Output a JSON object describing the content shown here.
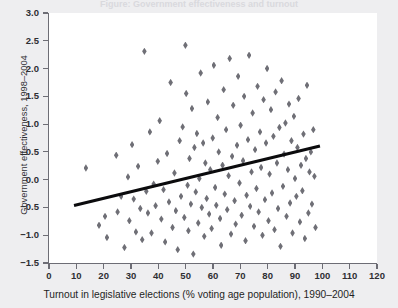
{
  "figure": {
    "clipped_title": "Figure: Government effectiveness and turnout",
    "background_color": "#eeeef0",
    "plot_background_color": "#ffffff",
    "marker_color": "#6f6f76",
    "trendline_color": "#0b0b0d",
    "axis_color": "#6d6d75"
  },
  "chart_data": {
    "type": "scatter",
    "title": "",
    "xlabel": "Turnout in legislative elections (% voting age population), 1990–2004",
    "ylabel": "Government effectiveness, 1998–2004",
    "xlim": [
      0,
      120
    ],
    "ylim": [
      -1.5,
      3.0
    ],
    "xticks": [
      0,
      10,
      20,
      30,
      40,
      50,
      60,
      70,
      80,
      90,
      100,
      110,
      120
    ],
    "yticks": [
      -1.5,
      -1.0,
      -0.5,
      0.0,
      0.5,
      1.0,
      1.5,
      2.0,
      2.5,
      3.0
    ],
    "xtick_labels": [
      "0",
      "10",
      "20",
      "30",
      "40",
      "50",
      "60",
      "70",
      "80",
      "90",
      "100",
      "110",
      "120"
    ],
    "ytick_labels": [
      "-1.5",
      "-1.0",
      "-0.5",
      "0.0",
      "0.5",
      "1.0",
      "1.5",
      "2.0",
      "2.5",
      "3.0"
    ],
    "grid": false,
    "legend": false,
    "marker": "diamond",
    "trendline": {
      "type": "linear-fit",
      "x_start": 9.0,
      "y_start": -0.47,
      "x_end": 99.0,
      "y_end": 0.6
    },
    "points": [
      [
        13.5,
        0.21
      ],
      [
        18.3,
        -0.82
      ],
      [
        20.5,
        -0.66
      ],
      [
        21.2,
        -1.04
      ],
      [
        24.6,
        0.44
      ],
      [
        25.1,
        -0.58
      ],
      [
        26.4,
        -0.3
      ],
      [
        27.6,
        -1.22
      ],
      [
        28.9,
        0.05
      ],
      [
        29.4,
        -0.74
      ],
      [
        30.4,
        0.63
      ],
      [
        31.0,
        -0.35
      ],
      [
        31.8,
        -0.94
      ],
      [
        32.6,
        0.24
      ],
      [
        33.4,
        -0.52
      ],
      [
        34.1,
        -1.08
      ],
      [
        34.9,
        2.31
      ],
      [
        35.6,
        -0.21
      ],
      [
        36.2,
        -0.6
      ],
      [
        36.9,
        0.86
      ],
      [
        37.5,
        -0.96
      ],
      [
        38.3,
        -0.08
      ],
      [
        39.0,
        -0.47
      ],
      [
        39.8,
        0.33
      ],
      [
        40.5,
        1.06
      ],
      [
        41.1,
        -0.71
      ],
      [
        41.9,
        -0.18
      ],
      [
        42.5,
        -1.12
      ],
      [
        43.2,
        0.47
      ],
      [
        43.9,
        -0.4
      ],
      [
        44.5,
        1.75
      ],
      [
        45.2,
        -0.86
      ],
      [
        45.9,
        0.12
      ],
      [
        46.4,
        -0.56
      ],
      [
        47.1,
        -1.26
      ],
      [
        47.8,
        0.7
      ],
      [
        48.3,
        -0.3
      ],
      [
        48.9,
        0.95
      ],
      [
        49.5,
        -0.68
      ],
      [
        49.9,
        2.42
      ],
      [
        50.2,
        1.55
      ],
      [
        50.7,
        -0.1
      ],
      [
        51.0,
        -0.92
      ],
      [
        51.4,
        0.38
      ],
      [
        51.9,
        -0.44
      ],
      [
        52.3,
        1.28
      ],
      [
        52.8,
        -1.34
      ],
      [
        53.2,
        0.58
      ],
      [
        53.7,
        -0.22
      ],
      [
        54.1,
        0.83
      ],
      [
        54.6,
        -0.78
      ],
      [
        55.0,
        0.02
      ],
      [
        55.5,
        1.92
      ],
      [
        55.9,
        -0.5
      ],
      [
        56.4,
        0.66
      ],
      [
        56.8,
        -1.02
      ],
      [
        57.2,
        0.3
      ],
      [
        57.7,
        -0.34
      ],
      [
        58.1,
        1.4
      ],
      [
        58.6,
        -0.62
      ],
      [
        59.0,
        0.18
      ],
      [
        59.5,
        -0.88
      ],
      [
        59.9,
        0.75
      ],
      [
        60.3,
        2.06
      ],
      [
        60.8,
        -0.14
      ],
      [
        61.2,
        -0.46
      ],
      [
        61.7,
        1.12
      ],
      [
        62.1,
        0.5
      ],
      [
        62.6,
        -0.7
      ],
      [
        63.0,
        -1.18
      ],
      [
        63.5,
        0.26
      ],
      [
        63.9,
        1.62
      ],
      [
        64.3,
        -0.26
      ],
      [
        64.8,
        0.9
      ],
      [
        65.2,
        -0.54
      ],
      [
        65.7,
        0.07
      ],
      [
        66.1,
        2.18
      ],
      [
        66.6,
        -0.98
      ],
      [
        67.0,
        0.42
      ],
      [
        67.4,
        1.34
      ],
      [
        67.9,
        -0.38
      ],
      [
        68.3,
        -0.8
      ],
      [
        68.8,
        0.62
      ],
      [
        69.2,
        1.86
      ],
      [
        69.7,
        -0.06
      ],
      [
        70.1,
        0.98
      ],
      [
        70.5,
        -0.64
      ],
      [
        71.0,
        0.34
      ],
      [
        71.4,
        1.5
      ],
      [
        71.9,
        -1.1
      ],
      [
        72.3,
        -0.28
      ],
      [
        72.8,
        0.72
      ],
      [
        73.2,
        2.24
      ],
      [
        73.6,
        -0.48
      ],
      [
        74.1,
        0.14
      ],
      [
        74.5,
        1.2
      ],
      [
        75.0,
        -0.84
      ],
      [
        75.4,
        0.54
      ],
      [
        75.9,
        -0.16
      ],
      [
        76.3,
        1.68
      ],
      [
        76.7,
        -0.58
      ],
      [
        77.2,
        0.86
      ],
      [
        77.6,
        0.22
      ],
      [
        78.1,
        -1.0
      ],
      [
        78.5,
        1.44
      ],
      [
        79.0,
        -0.36
      ],
      [
        79.4,
        0.66
      ],
      [
        79.8,
        2.0
      ],
      [
        80.3,
        -0.74
      ],
      [
        80.7,
        0.1
      ],
      [
        81.2,
        1.26
      ],
      [
        81.6,
        -0.24
      ],
      [
        82.1,
        0.78
      ],
      [
        82.5,
        -0.9
      ],
      [
        82.9,
        1.58
      ],
      [
        83.4,
        0.3
      ],
      [
        83.8,
        -0.52
      ],
      [
        84.3,
        0.94
      ],
      [
        84.7,
        -1.2
      ],
      [
        85.1,
        1.78
      ],
      [
        85.6,
        -0.12
      ],
      [
        86.0,
        0.46
      ],
      [
        86.5,
        1.02
      ],
      [
        86.9,
        -0.66
      ],
      [
        87.4,
        0.18
      ],
      [
        87.8,
        1.36
      ],
      [
        88.2,
        -0.42
      ],
      [
        88.7,
        0.7
      ],
      [
        89.1,
        -0.96
      ],
      [
        89.6,
        1.14
      ],
      [
        90.0,
        0.02
      ],
      [
        90.5,
        -0.3
      ],
      [
        90.9,
        0.58
      ],
      [
        91.3,
        1.46
      ],
      [
        91.8,
        -0.76
      ],
      [
        92.2,
        0.26
      ],
      [
        92.7,
        -0.2
      ],
      [
        93.1,
        0.82
      ],
      [
        93.6,
        -1.06
      ],
      [
        94.0,
        0.38
      ],
      [
        94.4,
        1.7
      ],
      [
        94.9,
        -0.6
      ],
      [
        95.3,
        0.14
      ],
      [
        95.8,
        0.5
      ],
      [
        96.2,
        -0.44
      ],
      [
        96.7,
        0.9
      ],
      [
        97.1,
        0.06
      ],
      [
        97.5,
        -0.86
      ]
    ]
  }
}
